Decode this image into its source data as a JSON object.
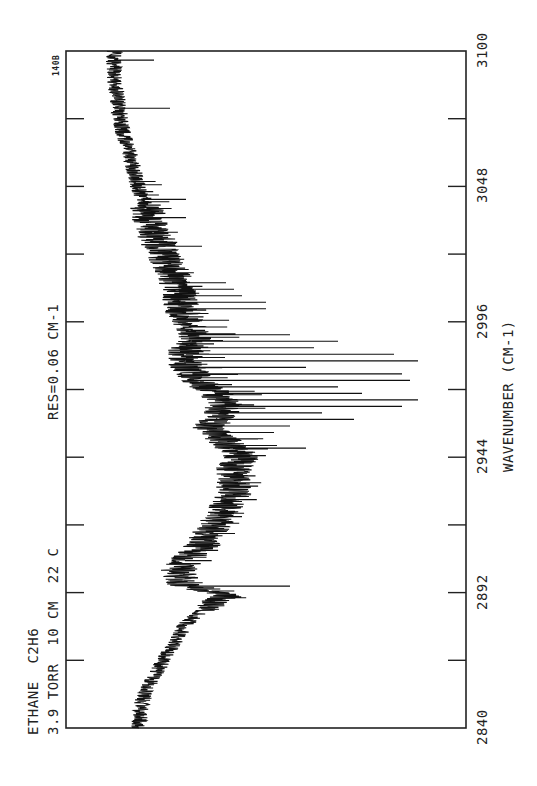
{
  "chart_data": {
    "type": "line",
    "title": "ETHANE C2H6",
    "annotations": {
      "sample": "ETHANE  C2H6",
      "conditions": "3.9 TORR  10 CM  22 C",
      "resolution": "RES=0.06 CM-1",
      "plot_id": "140B"
    },
    "xlabel": "WAVENUMBER (CM-1)",
    "ylabel": "",
    "orientation": "rotated: wavenumber axis vertical (bottom=2840, top=3100), absorbance increases to the right",
    "xlim": [
      2840,
      3100
    ],
    "x_ticks": [
      2840,
      2853,
      2866,
      2879,
      2892,
      2905,
      2918,
      2931,
      2944,
      2957,
      2970,
      2983,
      2996,
      3009,
      3022,
      3035,
      3048,
      3061,
      3074,
      3087,
      3100
    ],
    "x_tick_labels": [
      "2840",
      "2892",
      "2944",
      "2996",
      "3048",
      "3100"
    ],
    "grid": false,
    "legend": null,
    "baseline_envelope": {
      "x": [
        2840,
        2850,
        2860,
        2870,
        2880,
        2885,
        2890,
        2892,
        2895,
        2900,
        2905,
        2910,
        2920,
        2930,
        2940,
        2944,
        2950,
        2955,
        2960,
        2965,
        2970,
        2975,
        2980,
        2985,
        2990,
        2996,
        3000,
        3010,
        3020,
        3030,
        3040,
        3048,
        3060,
        3070,
        3080,
        3090,
        3100
      ],
      "y": [
        0.18,
        0.19,
        0.22,
        0.26,
        0.3,
        0.34,
        0.4,
        0.38,
        0.3,
        0.28,
        0.3,
        0.34,
        0.38,
        0.42,
        0.42,
        0.44,
        0.4,
        0.36,
        0.38,
        0.4,
        0.36,
        0.32,
        0.3,
        0.3,
        0.32,
        0.3,
        0.29,
        0.28,
        0.25,
        0.22,
        0.2,
        0.18,
        0.16,
        0.14,
        0.13,
        0.12,
        0.12
      ]
    },
    "peaks": {
      "x": [
        2894.5,
        2927,
        2947.5,
        2951,
        2953.5,
        2956,
        2958.5,
        2961,
        2963.5,
        2966,
        2968.5,
        2971,
        2973.5,
        2976,
        2978.5,
        2981,
        2983.5,
        2986,
        2988.5,
        2991,
        3001,
        3003.5,
        3006,
        3008.5,
        3011,
        3025,
        3036,
        3043,
        3078,
        3096.5
      ],
      "y": [
        0.56,
        0.44,
        0.6,
        0.48,
        0.52,
        0.56,
        0.72,
        0.64,
        0.84,
        0.88,
        0.74,
        0.68,
        0.86,
        0.84,
        0.6,
        0.88,
        0.82,
        0.62,
        0.68,
        0.56,
        0.5,
        0.5,
        0.44,
        0.42,
        0.4,
        0.34,
        0.3,
        0.3,
        0.26,
        0.22
      ]
    },
    "ylim": [
      0,
      1
    ]
  }
}
